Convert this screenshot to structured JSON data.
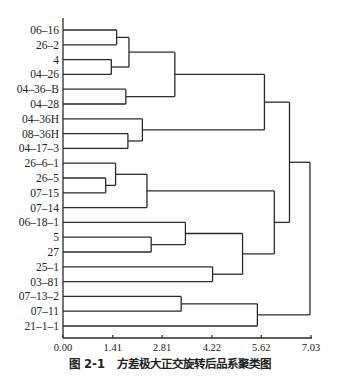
{
  "chart_data": {
    "type": "dendrogram",
    "title": "",
    "caption_number": "图 2-1",
    "caption_text": "方差极大正交旋转后品系聚类图",
    "xlabel": "",
    "ylabel": "",
    "xlim": [
      0,
      7.03
    ],
    "x_ticks": [
      "0.00",
      "1.41",
      "2.81",
      "4.22",
      "5.62",
      "7.03"
    ],
    "tick_values": [
      0,
      1.41,
      2.81,
      4.22,
      5.62,
      7.03
    ],
    "grid": false,
    "leaves": [
      "06-16",
      "26-2",
      "4",
      "04-26",
      "04-36-B",
      "04-28",
      "04-36H",
      "08-36H",
      "04-17-3",
      "26-6-1",
      "26-5",
      "07-15",
      "07-14",
      "06-18-1",
      "5",
      "27",
      "25-1",
      "03-81",
      "07-13-2",
      "07-11",
      "21-1-1"
    ],
    "merges": [
      {
        "id": "A",
        "left": "06-16",
        "right": "26-2",
        "height": 1.52
      },
      {
        "id": "B",
        "left": "4",
        "right": "04-26",
        "height": 1.37
      },
      {
        "id": "C",
        "left": "A",
        "right": "B",
        "height": 1.87
      },
      {
        "id": "D",
        "left": "04-36-B",
        "right": "04-28",
        "height": 1.78
      },
      {
        "id": "E",
        "left": "C",
        "right": "D",
        "height": 3.17
      },
      {
        "id": "F",
        "left": "08-36H",
        "right": "04-17-3",
        "height": 1.84
      },
      {
        "id": "G",
        "left": "04-36H",
        "right": "F",
        "height": 2.25
      },
      {
        "id": "H",
        "left": "E",
        "right": "G",
        "height": 5.71
      },
      {
        "id": "I",
        "left": "26-5",
        "right": "07-15",
        "height": 1.21
      },
      {
        "id": "J",
        "left": "26-6-1",
        "right": "I",
        "height": 1.49
      },
      {
        "id": "K",
        "left": "J",
        "right": "07-14",
        "height": 2.38
      },
      {
        "id": "L",
        "left": "5",
        "right": "27",
        "height": 2.5
      },
      {
        "id": "M",
        "left": "06-18-1",
        "right": "L",
        "height": 3.47
      },
      {
        "id": "N",
        "left": "25-1",
        "right": "03-81",
        "height": 4.24
      },
      {
        "id": "O",
        "left": "M",
        "right": "N",
        "height": 5.09
      },
      {
        "id": "P",
        "left": "K",
        "right": "O",
        "height": 5.99
      },
      {
        "id": "Q",
        "left": "H",
        "right": "P",
        "height": 6.42
      },
      {
        "id": "R",
        "left": "07-13-2",
        "right": "07-11",
        "height": 3.35
      },
      {
        "id": "S",
        "left": "R",
        "right": "21-1-1",
        "height": 5.51
      },
      {
        "id": "T",
        "left": "Q",
        "right": "S",
        "height": 7.0
      }
    ],
    "orientation": "horizontal",
    "legend": null
  },
  "colors": {
    "line": "#2a2a2a",
    "background": "#ffffff"
  }
}
